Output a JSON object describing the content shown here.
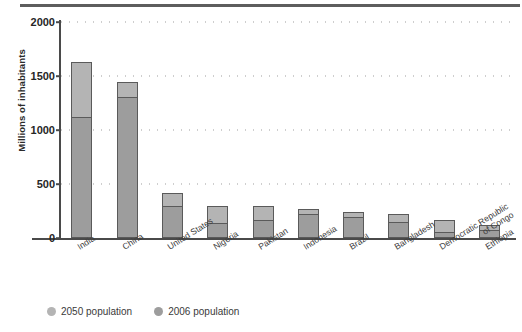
{
  "figure": {
    "y_axis_title": "Millions of inhabitants"
  },
  "legend": {
    "position": "bottom-left",
    "items": [
      {
        "label": "2050 population",
        "color": "#b4b4b4",
        "marker": "circle-marker"
      },
      {
        "label": "2006 population",
        "color": "#9d9d9d",
        "marker": "circle-marker"
      }
    ]
  },
  "chart_data": {
    "type": "bar",
    "title": "",
    "subtitle": "",
    "xlabel": "",
    "ylabel": "Millions of inhabitants",
    "ylim": [
      0,
      2000
    ],
    "ytick_labels": [
      "0",
      "500",
      "1000",
      "1500",
      "2000"
    ],
    "yticks": [
      0,
      500,
      1000,
      1500,
      2000
    ],
    "grid": "dotted-horizontal",
    "stacked": true,
    "categories": [
      "India",
      "China",
      "United States",
      "Nigeria",
      "Pakistan",
      "Indonesia",
      "Brazil",
      "Bangladesh",
      "Democratic Republic of Congo",
      "Ethiopia"
    ],
    "category_label_lines": [
      [
        "India"
      ],
      [
        "China"
      ],
      [
        "United States"
      ],
      [
        "Nigeria"
      ],
      [
        "Pakistan"
      ],
      [
        "Indonesia"
      ],
      [
        "Brazil"
      ],
      [
        "Bangladesh"
      ],
      [
        "Democratic Republic",
        "of Congo"
      ],
      [
        "Ethiopia"
      ]
    ],
    "series": [
      {
        "name": "2006 population",
        "color": "#9d9d9d",
        "values": [
          1120,
          1310,
          300,
          135,
          165,
          225,
          190,
          145,
          60,
          78
        ]
      },
      {
        "name": "2050 population",
        "color": "#b4b4b4",
        "values": [
          1630,
          1440,
          420,
          295,
          295,
          270,
          240,
          220,
          165,
          120
        ]
      }
    ]
  }
}
